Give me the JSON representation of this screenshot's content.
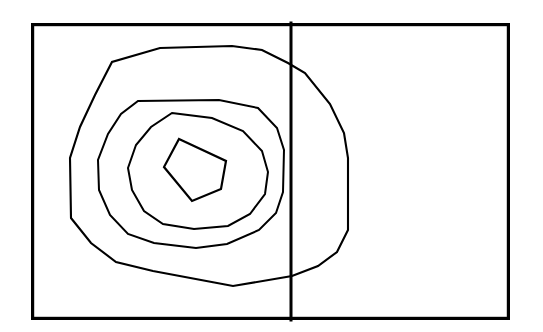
{
  "figure": {
    "background_color": "#ffffff",
    "canvas": {
      "width": 543,
      "height": 332
    }
  },
  "frame": {
    "name": "outer-rectangle",
    "stroke_color": "#000000",
    "stroke_width": 3.2,
    "x": 31,
    "y": 23,
    "width": 479,
    "height": 297
  },
  "divider": {
    "name": "vertical-divider",
    "orientation": "vertical",
    "stroke_color": "#000000",
    "stroke_width": 3.0,
    "x": 291,
    "y_top": 23,
    "y_bottom": 320,
    "label": ""
  },
  "panels": [
    {
      "name": "left-panel",
      "x": 31,
      "y": 23,
      "width": 260,
      "height": 297,
      "label": ""
    },
    {
      "name": "right-panel",
      "x": 291,
      "y": 23,
      "width": 219,
      "height": 297,
      "label": ""
    }
  ],
  "chart_data": {
    "type": "line",
    "title": "",
    "subtitle": "",
    "xlabel": "",
    "ylabel": "",
    "xlim": [
      31,
      510
    ],
    "ylim": [
      23,
      320
    ],
    "grid": false,
    "legend": "none",
    "annotations": [],
    "tick_labels": {
      "x": [],
      "y": []
    },
    "series": [
      {
        "name": "contour-level-1-outermost",
        "level": 1,
        "closed": true,
        "stroke_color": "#000000",
        "stroke_width": 2.1,
        "points": [
          [
            160,
            48
          ],
          [
            232,
            46
          ],
          [
            262,
            50
          ],
          [
            288,
            63
          ],
          [
            305,
            73
          ],
          [
            330,
            104
          ],
          [
            344,
            133
          ],
          [
            348,
            158
          ],
          [
            348,
            230
          ],
          [
            337,
            252
          ],
          [
            318,
            266
          ],
          [
            292,
            276
          ],
          [
            233,
            286
          ],
          [
            153,
            271
          ],
          [
            116,
            262
          ],
          [
            91,
            243
          ],
          [
            71,
            218
          ],
          [
            70,
            158
          ],
          [
            80,
            127
          ],
          [
            95,
            95
          ],
          [
            112,
            62
          ]
        ]
      },
      {
        "name": "contour-level-2",
        "level": 2,
        "closed": true,
        "stroke_color": "#000000",
        "stroke_width": 2.0,
        "points": [
          [
            138,
            101
          ],
          [
            219,
            100
          ],
          [
            258,
            108
          ],
          [
            277,
            128
          ],
          [
            284,
            150
          ],
          [
            283,
            192
          ],
          [
            276,
            213
          ],
          [
            259,
            230
          ],
          [
            227,
            244
          ],
          [
            196,
            248
          ],
          [
            154,
            243
          ],
          [
            128,
            234
          ],
          [
            110,
            215
          ],
          [
            99,
            190
          ],
          [
            98,
            160
          ],
          [
            108,
            134
          ],
          [
            121,
            114
          ]
        ]
      },
      {
        "name": "contour-level-3",
        "level": 3,
        "closed": true,
        "stroke_color": "#000000",
        "stroke_width": 2.0,
        "points": [
          [
            172,
            113
          ],
          [
            212,
            118
          ],
          [
            243,
            131
          ],
          [
            262,
            151
          ],
          [
            268,
            172
          ],
          [
            265,
            194
          ],
          [
            250,
            214
          ],
          [
            228,
            226
          ],
          [
            194,
            229
          ],
          [
            163,
            224
          ],
          [
            144,
            211
          ],
          [
            132,
            190
          ],
          [
            128,
            168
          ],
          [
            136,
            145
          ],
          [
            151,
            127
          ]
        ]
      },
      {
        "name": "contour-level-4-innermost",
        "level": 4,
        "closed": true,
        "stroke_color": "#000000",
        "stroke_width": 2.2,
        "points": [
          [
            179,
            139
          ],
          [
            226,
            161
          ],
          [
            221,
            189
          ],
          [
            192,
            201
          ],
          [
            164,
            167
          ]
        ]
      }
    ]
  }
}
